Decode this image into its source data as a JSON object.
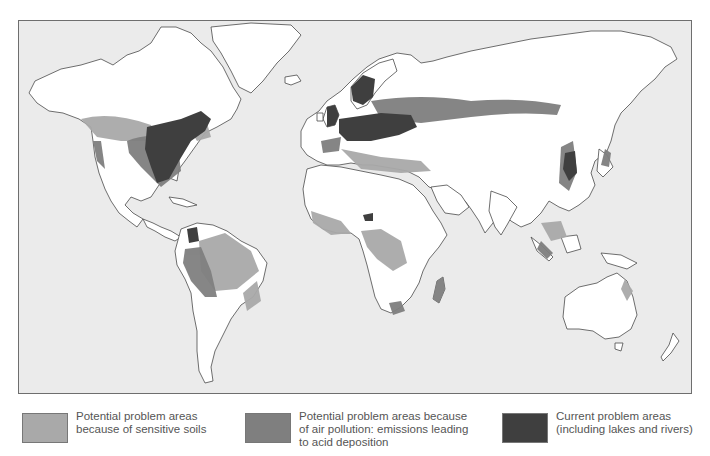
{
  "map": {
    "title": "World map of acid deposition problem areas",
    "colors": {
      "ocean": "#ebebeb",
      "land": "#ffffff",
      "border": "#4a4a4a",
      "sensitive_soils": "#a9a9a9",
      "air_pollution": "#7f7f7f",
      "current_problem": "#3f3f3f"
    }
  },
  "legend": {
    "items": [
      {
        "label": "Potential problem areas\nbecause of sensitive soils",
        "color": "#a9a9a9"
      },
      {
        "label": "Potential problem areas because\nof air pollution: emissions leading\nto acid deposition",
        "color": "#7f7f7f"
      },
      {
        "label": "Current problem areas\n(including lakes and rivers)",
        "color": "#3f3f3f"
      }
    ]
  }
}
